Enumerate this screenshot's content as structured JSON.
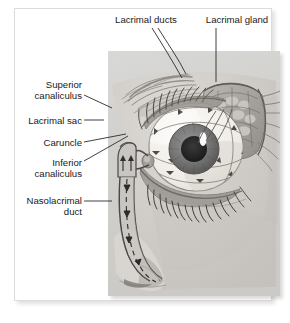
{
  "figure": {
    "type": "anatomical-illustration",
    "style": "grayscale pencil/airbrush medical drawing on gray plate",
    "colors": {
      "page_background": "#ffffff",
      "card_background": "#ffffff",
      "card_border": "#dcdcdc",
      "plate_background": "#d2d2d2",
      "label_text": "#1a1a1a",
      "leader_line": "#2b2b2b",
      "sclera": "#f6f4f0",
      "iris": "#7d7d7d",
      "pupil": "#232323",
      "eyelid_skin": "#cfcbc6",
      "lid_margin": "#8a8681",
      "duct_stroke": "#4a4a4a",
      "highlight": "#ffffff"
    }
  },
  "labels": [
    {
      "id": "lacrimal-ducts",
      "text": "Lacrimal ducts",
      "align": "center",
      "x": 104,
      "y": 14,
      "width": 84
    },
    {
      "id": "lacrimal-gland",
      "text": "Lacrimal gland",
      "align": "center",
      "x": 194,
      "y": 14,
      "width": 86
    },
    {
      "id": "superior-canaliculus",
      "text": "Superior\ncanaliculus",
      "align": "right",
      "x": 10,
      "y": 79,
      "width": 72
    },
    {
      "id": "lacrimal-sac",
      "text": "Lacrimal sac",
      "align": "right",
      "x": 10,
      "y": 115,
      "width": 72
    },
    {
      "id": "caruncle",
      "text": "Caruncle",
      "align": "right",
      "x": 10,
      "y": 137,
      "width": 72
    },
    {
      "id": "inferior-canaliculus",
      "text": "Inferior\ncanaliculus",
      "align": "right",
      "x": 10,
      "y": 157,
      "width": 72
    },
    {
      "id": "nasolacrimal-duct",
      "text": "Nasolacrimal\nduct",
      "align": "right",
      "x": 6,
      "y": 195,
      "width": 76
    }
  ],
  "structures": [
    {
      "id": "eyebrow",
      "name": "Eyebrow"
    },
    {
      "id": "upper-eyelid",
      "name": "Upper eyelid with lashes"
    },
    {
      "id": "lower-eyelid",
      "name": "Lower eyelid with lashes"
    },
    {
      "id": "sclera",
      "name": "Sclera"
    },
    {
      "id": "iris",
      "name": "Iris"
    },
    {
      "id": "pupil",
      "name": "Pupil"
    },
    {
      "id": "corneal-highlight",
      "name": "Corneal light reflex"
    },
    {
      "id": "lacrimal-gland-body",
      "name": "Lacrimal gland (cut-away under upper lid)"
    },
    {
      "id": "lacrimal-ducts-body",
      "name": "Lacrimal excretory ducts"
    },
    {
      "id": "tear-flow-arrows",
      "name": "Tear flow direction arrows across the eye"
    },
    {
      "id": "superior-canaliculus-body",
      "name": "Superior canaliculus"
    },
    {
      "id": "inferior-canaliculus-body",
      "name": "Inferior canaliculus"
    },
    {
      "id": "lacrimal-sac-body",
      "name": "Lacrimal sac"
    },
    {
      "id": "caruncle-body",
      "name": "Lacrimal caruncle"
    },
    {
      "id": "nasolacrimal-duct-body",
      "name": "Nasolacrimal duct descending to the nose"
    },
    {
      "id": "nose",
      "name": "Nose and nostril"
    }
  ]
}
